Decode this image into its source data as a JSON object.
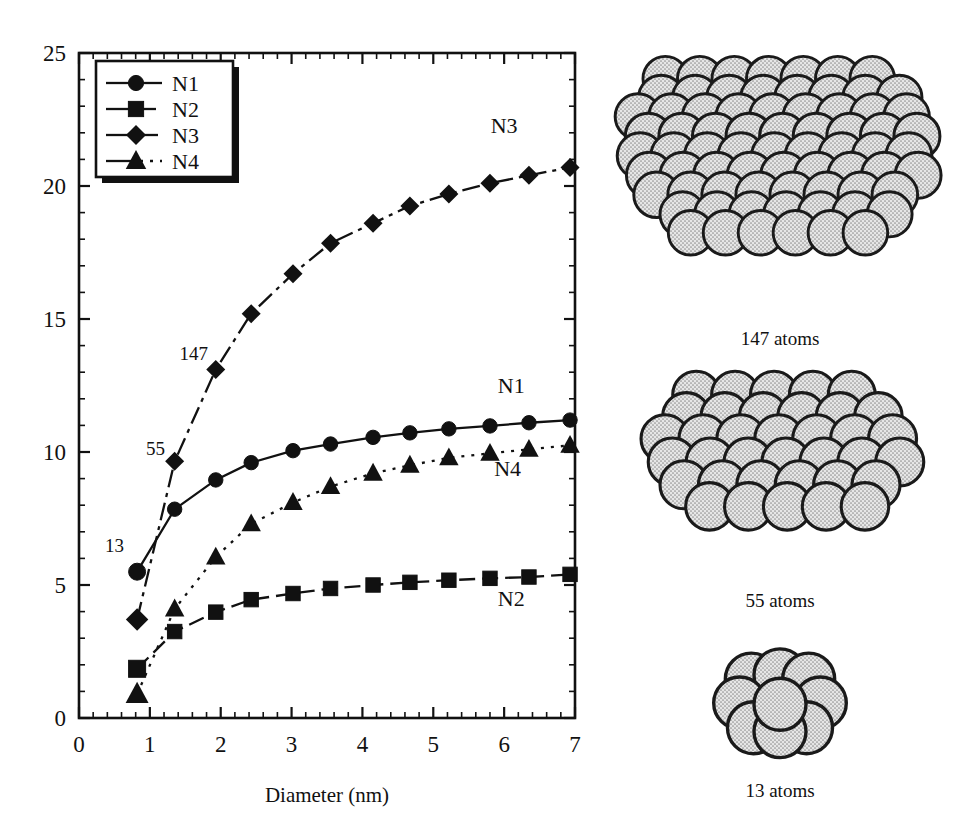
{
  "chart_data": {
    "type": "line",
    "title": "",
    "xlabel": "Diameter (nm)",
    "ylabel": "",
    "xlim": [
      0,
      7
    ],
    "ylim": [
      0,
      25
    ],
    "xticks": [
      0,
      1,
      2,
      3,
      4,
      5,
      6,
      7
    ],
    "yticks": [
      0,
      5,
      10,
      15,
      20,
      25
    ],
    "xtick_labels": [
      "0",
      "1",
      "2",
      "3",
      "4",
      "5",
      "6",
      "7"
    ],
    "ytick_labels": [
      "0",
      "5",
      "10",
      "15",
      "20",
      "25"
    ],
    "x_minor_step": 0.2,
    "y_minor_step": 1,
    "grid": false,
    "legend_position": "top-left",
    "x": [
      0.82,
      1.35,
      1.93,
      2.43,
      3.02,
      3.55,
      4.15,
      4.67,
      5.22,
      5.8,
      6.35,
      6.93
    ],
    "series": [
      {
        "name": "N1",
        "marker": "circle",
        "linestyle": "solid",
        "values": [
          5.5,
          7.85,
          8.95,
          9.6,
          10.05,
          10.3,
          10.55,
          10.72,
          10.87,
          10.98,
          11.1,
          11.2
        ]
      },
      {
        "name": "N2",
        "marker": "square",
        "linestyle": "dashed",
        "values": [
          1.85,
          3.25,
          3.98,
          4.45,
          4.68,
          4.87,
          5.0,
          5.1,
          5.18,
          5.25,
          5.3,
          5.4
        ]
      },
      {
        "name": "N3",
        "marker": "diamond",
        "linestyle": "dashdot",
        "values": [
          3.7,
          9.65,
          13.1,
          15.2,
          16.7,
          17.85,
          18.6,
          19.25,
          19.7,
          20.1,
          20.4,
          20.7
        ]
      },
      {
        "name": "N4",
        "marker": "triangle",
        "linestyle": "dotted",
        "values": [
          0.9,
          4.1,
          6.05,
          7.3,
          8.1,
          8.7,
          9.2,
          9.5,
          9.78,
          9.95,
          10.1,
          10.25
        ]
      }
    ],
    "legend_entries": [
      {
        "label": "N1",
        "marker": "circle",
        "linestyle": "solid"
      },
      {
        "label": "N2",
        "marker": "square",
        "linestyle": "dashed"
      },
      {
        "label": "N3",
        "marker": "diamond",
        "linestyle": "dashdot"
      },
      {
        "label": "N4",
        "marker": "triangle",
        "linestyle": "dotted"
      }
    ],
    "series_labels": [
      {
        "text": "N3",
        "x": 6.0,
        "y": 22.0
      },
      {
        "text": "N1",
        "x": 6.1,
        "y": 12.2
      },
      {
        "text": "N4",
        "x": 6.05,
        "y": 9.1
      },
      {
        "text": "N2",
        "x": 6.1,
        "y": 4.2
      }
    ],
    "annotations": [
      {
        "text": "13",
        "x": 0.5,
        "y": 6.25
      },
      {
        "text": "55",
        "x": 1.08,
        "y": 9.9
      },
      {
        "text": "147",
        "x": 1.62,
        "y": 13.45
      }
    ],
    "line_color": "#111111",
    "marker_color": "#111111",
    "background_color": "#ffffff"
  },
  "clusters": [
    {
      "caption": "147 atoms",
      "shells": 2,
      "atom_count": 147
    },
    {
      "caption": "55 atoms",
      "shells": 1,
      "atom_count": 55
    },
    {
      "caption": "13 atoms",
      "shells": 0,
      "atom_count": 13
    }
  ],
  "colors": {
    "ink": "#111111",
    "sphere_fill": "#d8d8d8",
    "sphere_stroke": "#1a1a1a",
    "page": "#ffffff"
  }
}
